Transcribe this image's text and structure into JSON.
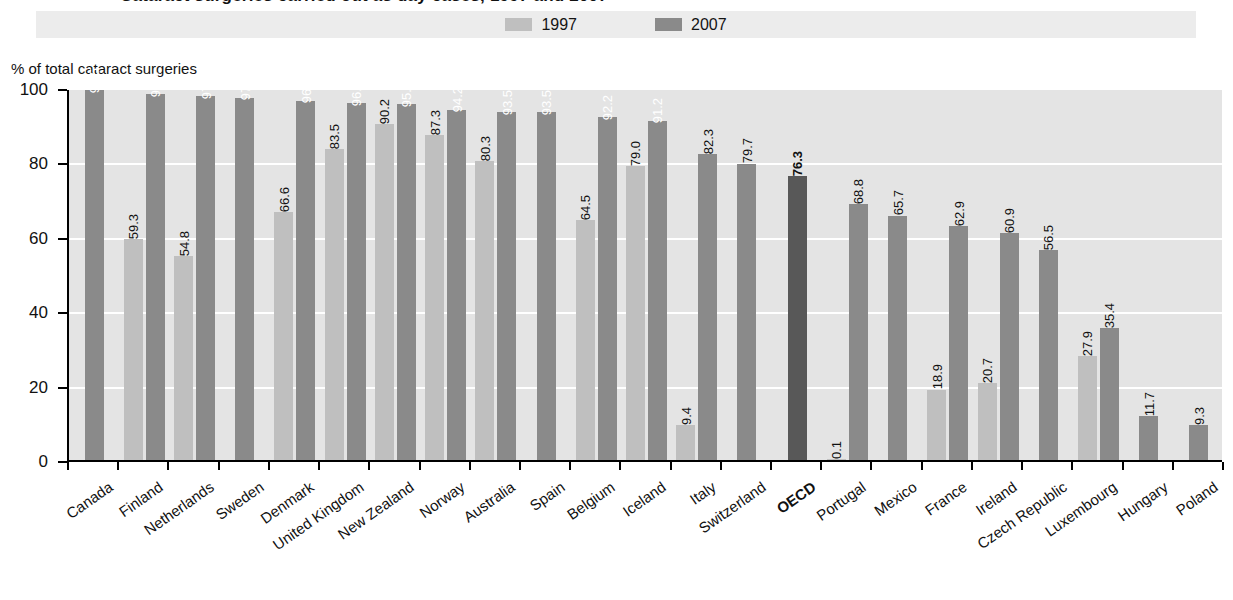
{
  "title": "Cataract surgeries carried out as day cases, 1997 and 2007",
  "legend": {
    "entries": [
      {
        "label": "1997",
        "color": "#bfbfbf"
      },
      {
        "label": "2007",
        "color": "#8a8a8a"
      }
    ]
  },
  "y_unit_caption": "% of total cataract surgeries",
  "colors": {
    "bar_1997": "#bfbfbf",
    "bar_2007": "#8a8a8a",
    "bar_oecd": "#585858",
    "plot_background": "#e4e4e4",
    "gridline": "#ffffff",
    "legend_background": "#ececec",
    "axis": "#000000"
  },
  "chart_data": {
    "type": "bar",
    "title": "Cataract surgeries carried out as day cases, 1997 and 2007",
    "xlabel": "",
    "ylabel": "% of total cataract surgeries",
    "ylim": [
      0,
      100
    ],
    "yticks": [
      0,
      20,
      40,
      60,
      80,
      100
    ],
    "grid": true,
    "legend_position": "top",
    "categories": [
      "Canada",
      "Finland",
      "Netherlands",
      "Sweden",
      "Denmark",
      "United Kingdom",
      "New Zealand",
      "Norway",
      "Australia",
      "Spain",
      "Belgium",
      "Iceland",
      "Italy",
      "Switzerland",
      "OECD",
      "Portugal",
      "Mexico",
      "France",
      "Ireland",
      "Czech Republic",
      "Luxembourg",
      "Hungary",
      "Poland"
    ],
    "highlight_category": "OECD",
    "series": [
      {
        "name": "1997",
        "color": "#bfbfbf",
        "values": [
          null,
          59.3,
          54.8,
          null,
          66.6,
          83.5,
          90.2,
          87.3,
          80.3,
          null,
          64.5,
          79.0,
          9.4,
          null,
          null,
          0.1,
          null,
          18.9,
          20.7,
          null,
          27.9,
          null,
          null
        ]
      },
      {
        "name": "2007",
        "color": "#8a8a8a",
        "values": [
          99.5,
          98.4,
          97.8,
          97.4,
          96.6,
          96.0,
          95.6,
          94.2,
          93.5,
          93.5,
          92.2,
          91.2,
          82.3,
          79.7,
          76.3,
          68.8,
          65.7,
          62.9,
          60.9,
          56.5,
          35.4,
          11.7,
          9.3
        ]
      }
    ],
    "data_labels": {
      "1997": [
        "",
        "59.3",
        "54.8",
        "",
        "66.6",
        "83.5",
        "90.2",
        "87.3",
        "80.3",
        "",
        "64.5",
        "79.0",
        "9.4",
        "",
        "",
        "0.1",
        "",
        "18.9",
        "20.7",
        "",
        "27.9",
        "",
        ""
      ],
      "2007": [
        "99.5",
        "98.4",
        "97.8",
        "97.4",
        "96.6",
        "96.0",
        "95.6",
        "94.2",
        "93.5",
        "93.5",
        "92.2",
        "91.2",
        "82.3",
        "79.7",
        "76.3",
        "68.8",
        "65.7",
        "62.9",
        "60.9",
        "56.5",
        "35.4",
        "11.7",
        "9.3"
      ]
    }
  }
}
